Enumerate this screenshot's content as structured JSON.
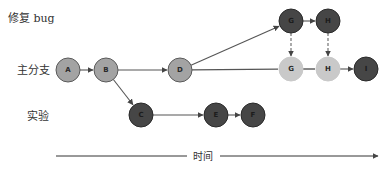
{
  "lanes": [
    {
      "id": "bugfix",
      "label": "修复 bug",
      "x": 8,
      "y": 22
    },
    {
      "id": "main",
      "label": "主分支",
      "x": 17,
      "y": 74
    },
    {
      "id": "experiment",
      "label": "实验",
      "x": 27,
      "y": 120
    }
  ],
  "colors": {
    "medium": "#a3a3a3",
    "medium_stroke": "#5a5a5a",
    "dark": "#464646",
    "dark_stroke": "#2a2a2a",
    "light": "#c9c9c9",
    "light_stroke": "#c9c9c9",
    "edge": "#555555",
    "dashed_edge": "#666666"
  },
  "nodes": [
    {
      "id": "A",
      "label": "A",
      "x": 68,
      "y": 70,
      "style": "medium"
    },
    {
      "id": "B",
      "label": "B",
      "x": 106,
      "y": 70,
      "style": "medium"
    },
    {
      "id": "D",
      "label": "D",
      "x": 180,
      "y": 70,
      "style": "medium"
    },
    {
      "id": "G1",
      "label": "G",
      "x": 291,
      "y": 21,
      "style": "dark"
    },
    {
      "id": "H1",
      "label": "H",
      "x": 328,
      "y": 21,
      "style": "dark"
    },
    {
      "id": "G2",
      "label": "G",
      "x": 291,
      "y": 69,
      "style": "light"
    },
    {
      "id": "H2",
      "label": "H",
      "x": 328,
      "y": 69,
      "style": "light"
    },
    {
      "id": "I",
      "label": "I",
      "x": 366,
      "y": 69,
      "style": "dark"
    },
    {
      "id": "C",
      "label": "C",
      "x": 141,
      "y": 115,
      "style": "dark"
    },
    {
      "id": "E",
      "label": "E",
      "x": 216,
      "y": 115,
      "style": "dark"
    },
    {
      "id": "F",
      "label": "F",
      "x": 253,
      "y": 115,
      "style": "dark"
    }
  ],
  "edges": [
    {
      "from": "A",
      "to": "B",
      "type": "solid"
    },
    {
      "from": "B",
      "to": "D",
      "type": "solid"
    },
    {
      "from": "D",
      "to": "G1",
      "type": "solid"
    },
    {
      "from": "G1",
      "to": "H1",
      "type": "solid"
    },
    {
      "from": "D",
      "to": "G2",
      "type": "line"
    },
    {
      "from": "G2",
      "to": "H2",
      "type": "line"
    },
    {
      "from": "H2",
      "to": "I",
      "type": "solid"
    },
    {
      "from": "G1",
      "to": "G2",
      "type": "dashed"
    },
    {
      "from": "H1",
      "to": "H2",
      "type": "dashed"
    },
    {
      "from": "B",
      "to": "C",
      "type": "solid"
    },
    {
      "from": "C",
      "to": "E",
      "type": "solid"
    },
    {
      "from": "E",
      "to": "F",
      "type": "solid"
    }
  ],
  "node_radius": 12,
  "time_axis": {
    "label": "时间",
    "y": 156,
    "x_start": 56,
    "x_end": 378,
    "label_x": 203,
    "gap_left": 187,
    "gap_right": 220
  }
}
